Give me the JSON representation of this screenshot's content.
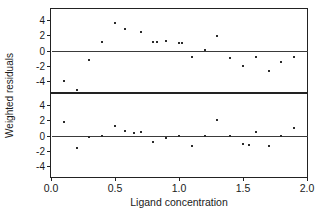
{
  "chart_data": {
    "type": "scatter",
    "title": "",
    "xlabel": "Ligand concentration",
    "ylabel": "Weighted residuals",
    "xlim": [
      0.0,
      2.0
    ],
    "ylim": [
      -5.5,
      5.5
    ],
    "grid": false,
    "legend": null,
    "xticks": [
      0.0,
      0.5,
      1.0,
      1.5,
      2.0
    ],
    "xticklabels": [
      "0.0",
      "0.5",
      "1.0",
      "1.5",
      "2.0"
    ],
    "yticks": [
      -4,
      -2,
      0,
      2,
      4
    ],
    "yticklabels": [
      "-4",
      "-2",
      "0",
      "2",
      "4"
    ],
    "panels": [
      {
        "name": "upper-panel",
        "reference_line": 0,
        "points": [
          {
            "x": 0.1,
            "y": -4.1
          },
          {
            "x": 0.2,
            "y": -5.2
          },
          {
            "x": 0.3,
            "y": -1.2
          },
          {
            "x": 0.4,
            "y": 1.1
          },
          {
            "x": 0.5,
            "y": 3.6
          },
          {
            "x": 0.58,
            "y": 2.9
          },
          {
            "x": 0.7,
            "y": 2.5
          },
          {
            "x": 0.8,
            "y": 1.1
          },
          {
            "x": 0.83,
            "y": 1.1
          },
          {
            "x": 0.9,
            "y": 1.2
          },
          {
            "x": 1.0,
            "y": 1.0
          },
          {
            "x": 1.02,
            "y": 1.0
          },
          {
            "x": 1.1,
            "y": -0.9
          },
          {
            "x": 1.2,
            "y": 0.05
          },
          {
            "x": 1.3,
            "y": 1.9
          },
          {
            "x": 1.4,
            "y": -1.0
          },
          {
            "x": 1.5,
            "y": -2.0
          },
          {
            "x": 1.6,
            "y": -0.9
          },
          {
            "x": 1.7,
            "y": -2.7
          },
          {
            "x": 1.8,
            "y": -1.5
          },
          {
            "x": 1.9,
            "y": -0.9
          }
        ]
      },
      {
        "name": "lower-panel",
        "reference_line": 0,
        "points": [
          {
            "x": 0.1,
            "y": 1.8
          },
          {
            "x": 0.2,
            "y": -1.7
          },
          {
            "x": 0.3,
            "y": -0.2
          },
          {
            "x": 0.4,
            "y": -0.1
          },
          {
            "x": 0.5,
            "y": 1.3
          },
          {
            "x": 0.58,
            "y": 0.6
          },
          {
            "x": 0.65,
            "y": 0.3
          },
          {
            "x": 0.7,
            "y": 0.4
          },
          {
            "x": 0.8,
            "y": -0.8
          },
          {
            "x": 0.9,
            "y": -0.3
          },
          {
            "x": 1.0,
            "y": -0.1
          },
          {
            "x": 1.1,
            "y": -1.4
          },
          {
            "x": 1.2,
            "y": -0.1
          },
          {
            "x": 1.3,
            "y": 2.1
          },
          {
            "x": 1.4,
            "y": -0.1
          },
          {
            "x": 1.5,
            "y": -1.1
          },
          {
            "x": 1.55,
            "y": -1.2
          },
          {
            "x": 1.6,
            "y": 0.4
          },
          {
            "x": 1.7,
            "y": -1.4
          },
          {
            "x": 1.8,
            "y": -0.1
          },
          {
            "x": 1.9,
            "y": 1.0
          }
        ]
      }
    ]
  }
}
